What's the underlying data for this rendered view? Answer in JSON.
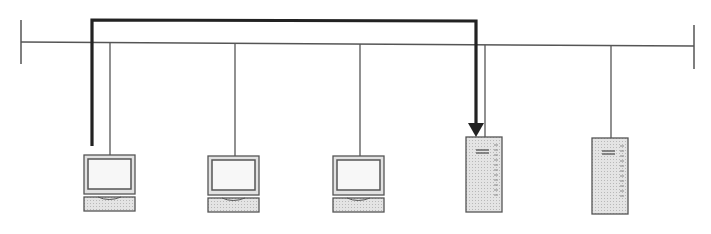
{
  "diagram": {
    "type": "network-bus-topology",
    "bus": {
      "x1": 21,
      "y1": 42,
      "x2": 694,
      "y2": 46,
      "color": "#555555"
    },
    "nodes": [
      {
        "kind": "workstation",
        "name": "workstation-1",
        "x": 84,
        "y": 155,
        "drop_x": 110
      },
      {
        "kind": "workstation",
        "name": "workstation-2",
        "x": 208,
        "y": 155,
        "drop_x": 235
      },
      {
        "kind": "workstation",
        "name": "workstation-3",
        "x": 333,
        "y": 155,
        "drop_x": 360
      },
      {
        "kind": "server",
        "name": "server-1",
        "x": 466,
        "y": 137,
        "drop_x": 485
      },
      {
        "kind": "server",
        "name": "server-2",
        "x": 592,
        "y": 138,
        "drop_x": 611
      }
    ],
    "path_arrow": {
      "from": "workstation-1",
      "to": "server-1",
      "color": "#222222"
    }
  }
}
